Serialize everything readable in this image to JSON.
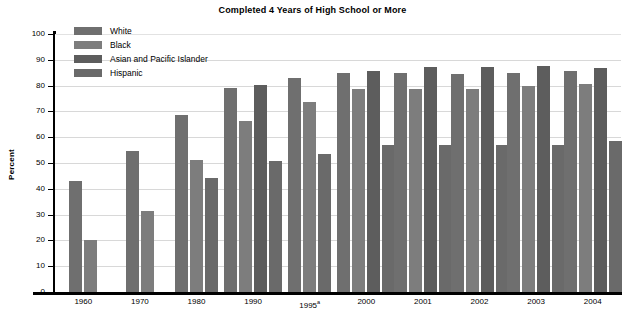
{
  "chart_data": {
    "type": "bar",
    "title": "Completed 4 Years of High School or More",
    "xlabel": "",
    "ylabel": "Percent",
    "ylim": [
      0,
      100
    ],
    "ytick_step": 10,
    "yticks": [
      0,
      10,
      20,
      30,
      40,
      50,
      60,
      70,
      80,
      90,
      100
    ],
    "grid": true,
    "legend_position": "top-left-inside",
    "categories": [
      "1960",
      "1970",
      "1980",
      "1990",
      "1995",
      "2000",
      "2001",
      "2002",
      "2003",
      "2004"
    ],
    "category_labels": [
      "1960",
      "1970",
      "1980",
      "1990",
      "1995ᵃ",
      "2000",
      "2001",
      "2002",
      "2003",
      "2004"
    ],
    "category_footnote_marker": "a",
    "category_footnote_on": "1995",
    "series": [
      {
        "name": "White",
        "color": "#6f6f6f",
        "values": [
          43.2,
          54.5,
          68.8,
          79.1,
          83.0,
          84.9,
          84.8,
          84.5,
          85.0,
          85.8
        ]
      },
      {
        "name": "Black",
        "color": "#7d7d7d",
        "values": [
          20.1,
          31.4,
          51.2,
          66.2,
          73.8,
          78.5,
          78.6,
          78.7,
          79.8,
          80.6
        ]
      },
      {
        "name": "Asian and Pacific Islander",
        "color": "#5d5d5d",
        "values": [
          null,
          null,
          null,
          80.4,
          null,
          85.7,
          87.4,
          87.4,
          87.6,
          86.8
        ]
      },
      {
        "name": "Hispanic",
        "color": "#6a6a6a",
        "values": [
          null,
          null,
          44.0,
          50.8,
          53.4,
          57.0,
          56.8,
          57.0,
          57.0,
          58.4
        ]
      }
    ]
  },
  "legend": {
    "items": [
      {
        "label": "White",
        "key": "white"
      },
      {
        "label": "Black",
        "key": "black"
      },
      {
        "label": "Asian and Pacific Islander",
        "key": "api"
      },
      {
        "label": "Hispanic",
        "key": "hispanic"
      }
    ]
  },
  "axis": {
    "y_title": "Percent"
  }
}
